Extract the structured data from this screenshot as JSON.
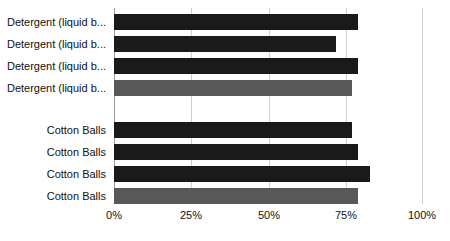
{
  "chart_data": {
    "type": "bar",
    "orientation": "horizontal",
    "title": "",
    "subtitle": "",
    "xlabel": "",
    "ylabel": "",
    "xlim": [
      0,
      100
    ],
    "xticks": [
      0,
      25,
      50,
      75,
      100
    ],
    "xtick_labels": [
      "0%",
      "25%",
      "50%",
      "75%",
      "100%"
    ],
    "grid": true,
    "grid_axis": "x",
    "legend": false,
    "legend_position": "none",
    "value_format": "percent",
    "categories": [
      "Detergent (liquid b...",
      "Detergent (liquid b...",
      "Detergent (liquid b...",
      "Detergent (liquid b...",
      "Cotton Balls",
      "Cotton Balls",
      "Cotton Balls",
      "Cotton Balls"
    ],
    "values": [
      79,
      72,
      79,
      77,
      77,
      79,
      83,
      79
    ],
    "bars": [
      {
        "label": "Detergent (liquid b...",
        "value": 79,
        "color": "#1a1a1a",
        "group": "detergent"
      },
      {
        "label": "Detergent (liquid b...",
        "value": 72,
        "color": "#1a1a1a",
        "group": "detergent"
      },
      {
        "label": "Detergent (liquid b...",
        "value": 79,
        "color": "#1a1a1a",
        "group": "detergent"
      },
      {
        "label": "Detergent (liquid b...",
        "value": 77,
        "color": "#585858",
        "group": "detergent"
      },
      {
        "label": "Cotton Balls",
        "value": 77,
        "color": "#1a1a1a",
        "group": "cotton"
      },
      {
        "label": "Cotton Balls",
        "value": 79,
        "color": "#1a1a1a",
        "group": "cotton"
      },
      {
        "label": "Cotton Balls",
        "value": 83,
        "color": "#1a1a1a",
        "group": "cotton"
      },
      {
        "label": "Cotton Balls",
        "value": 79,
        "color": "#585858",
        "group": "cotton"
      }
    ],
    "colors": {
      "bar_dark": "#1a1a1a",
      "bar_gray": "#585858",
      "gridline": "#d0d0d0",
      "axis": "#9a9a9a",
      "text": "#111111",
      "background": "#ffffff"
    }
  }
}
